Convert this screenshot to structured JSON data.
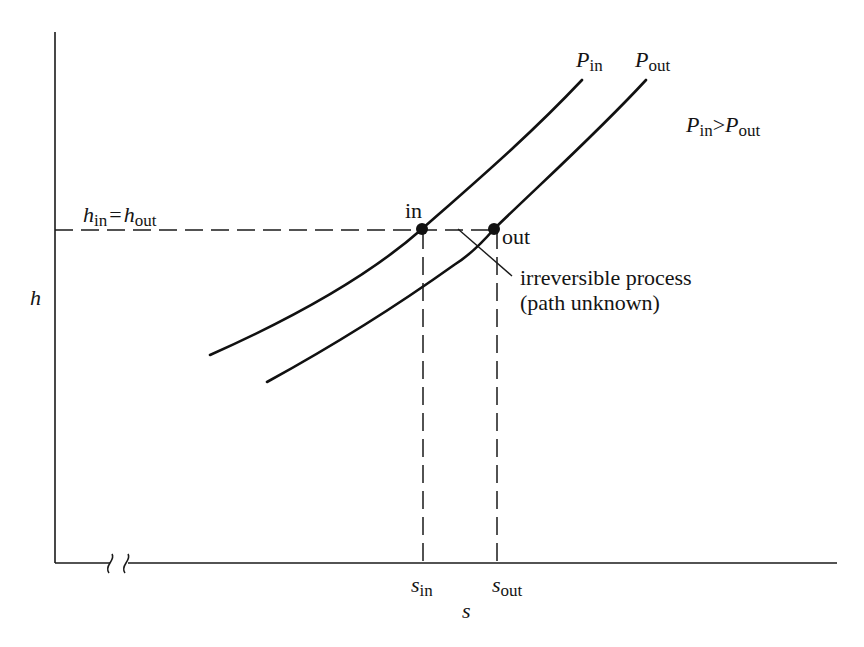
{
  "figure": {
    "type": "h-s diagram (throttling / irreversible process)",
    "y_axis_label": "h",
    "x_axis_label": "s",
    "x_ticks": [
      {
        "main": "s",
        "sub": "in"
      },
      {
        "main": "s",
        "sub": "out"
      }
    ],
    "hline_label": {
      "left": "h",
      "left_sub": "in",
      "eq": "=",
      "right": "h",
      "right_sub": "out"
    },
    "curves": [
      {
        "name": "P",
        "sub": "in"
      },
      {
        "name": "P",
        "sub": "out"
      }
    ],
    "condition": {
      "a": "P",
      "a_sub": "in",
      "op": ">",
      "b": "P",
      "b_sub": "out"
    },
    "points": [
      {
        "label": "in"
      },
      {
        "label": "out"
      }
    ],
    "annotation": {
      "line1": "irreversible process",
      "line2": "(path unknown)"
    },
    "axis_break": true,
    "colors": {
      "ink": "#111111",
      "background": "#ffffff"
    }
  }
}
